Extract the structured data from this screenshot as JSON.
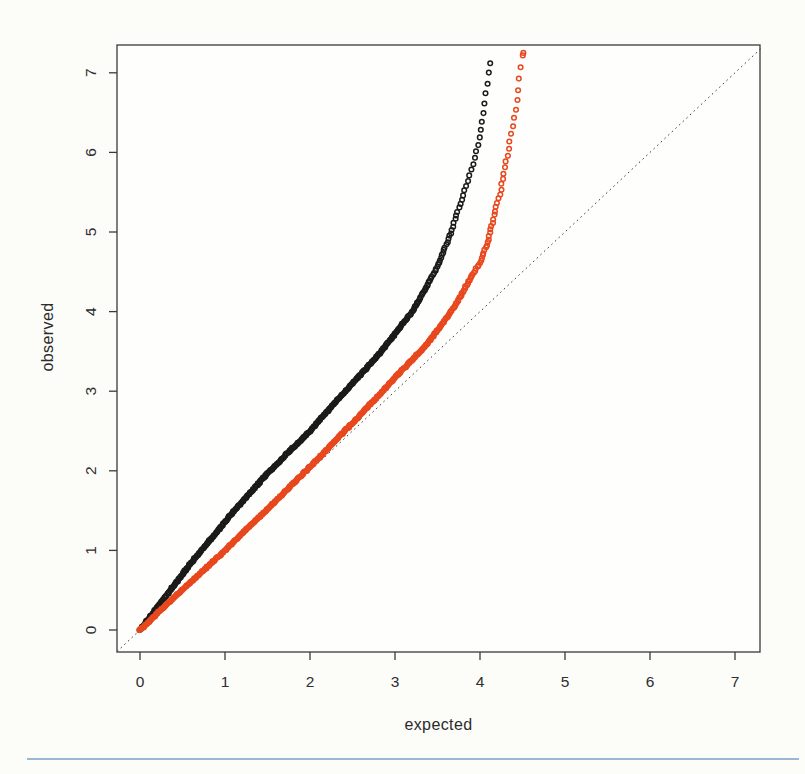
{
  "page": {
    "background": "#fcfcf9",
    "divider": {
      "color": "#9db6d2"
    }
  },
  "chart_data": {
    "type": "scatter",
    "title": "",
    "xlabel": "expected",
    "ylabel": "observed",
    "x_ticks": [
      "0",
      "1",
      "2",
      "3",
      "4",
      "5",
      "6",
      "7"
    ],
    "y_ticks": [
      "0",
      "1",
      "2",
      "3",
      "4",
      "5",
      "6",
      "7"
    ],
    "xlim": [
      -0.27,
      7.3
    ],
    "ylim": [
      -0.28,
      7.35
    ],
    "grid": false,
    "legend": "none",
    "frame_color": "#3a3a3a",
    "tick_label_color": "#2e2e2e",
    "plot_background": "#fefefc",
    "identity_line": {
      "style": "dotted",
      "slope": 1,
      "intercept": 0,
      "color": "#3c3c3c"
    },
    "marker": "open-circle",
    "series": [
      {
        "name": "black-qq-series",
        "color": "#1b1b1b",
        "max_expected": 4.12,
        "max_observed": 7.12,
        "points_expected_observed": [
          [
            0,
            0
          ],
          [
            0.3,
            0.42
          ],
          [
            0.6,
            0.84
          ],
          [
            1,
            1.36
          ],
          [
            1.5,
            1.97
          ],
          [
            2,
            2.5
          ],
          [
            2.5,
            3.1
          ],
          [
            2.8,
            3.45
          ],
          [
            3,
            3.72
          ],
          [
            3.2,
            4.0
          ],
          [
            3.35,
            4.27
          ],
          [
            3.5,
            4.57
          ],
          [
            3.65,
            4.97
          ],
          [
            3.75,
            5.3
          ],
          [
            3.85,
            5.62
          ],
          [
            3.92,
            5.86
          ],
          [
            3.98,
            6.12
          ],
          [
            4.02,
            6.36
          ],
          [
            4.05,
            6.6
          ],
          [
            4.08,
            6.85
          ],
          [
            4.1,
            7.0
          ],
          [
            4.12,
            7.12
          ]
        ]
      },
      {
        "name": "red-qq-series",
        "color": "#e8481e",
        "max_expected": 4.51,
        "max_observed": 7.25,
        "points_expected_observed": [
          [
            0,
            0
          ],
          [
            0.5,
            0.51
          ],
          [
            1,
            1.0
          ],
          [
            1.5,
            1.52
          ],
          [
            2,
            2.05
          ],
          [
            2.5,
            2.6
          ],
          [
            3,
            3.17
          ],
          [
            3.3,
            3.5
          ],
          [
            3.5,
            3.76
          ],
          [
            3.7,
            4.06
          ],
          [
            3.9,
            4.44
          ],
          [
            4,
            4.61
          ],
          [
            4.1,
            4.9
          ],
          [
            4.18,
            5.28
          ],
          [
            4.24,
            5.5
          ],
          [
            4.29,
            5.8
          ],
          [
            4.33,
            6.0
          ],
          [
            4.36,
            6.2
          ],
          [
            4.41,
            6.45
          ],
          [
            4.43,
            6.56
          ],
          [
            4.46,
            6.95
          ],
          [
            4.49,
            7.1
          ],
          [
            4.51,
            7.25
          ]
        ]
      }
    ]
  }
}
